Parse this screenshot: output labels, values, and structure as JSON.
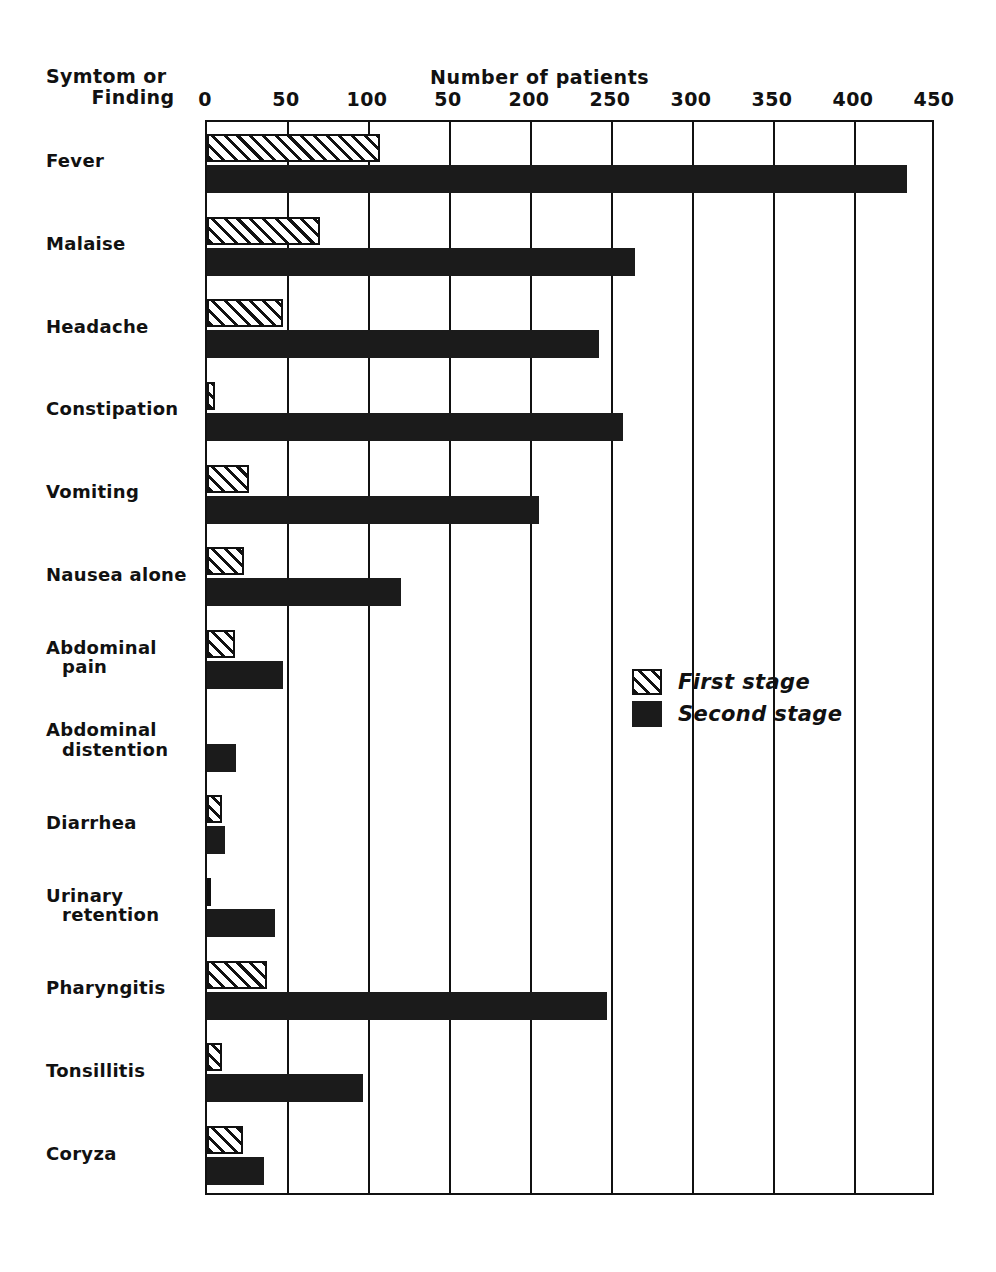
{
  "chart_data": {
    "type": "bar",
    "orientation": "horizontal",
    "title": "",
    "xlabel": "Number of patients",
    "ylabel": "Symtom or Finding",
    "corner_label_line1": "Symtom or",
    "corner_label_line2": "Finding",
    "xlim": [
      0,
      450
    ],
    "grid": true,
    "tick_values": [
      0,
      50,
      100,
      150,
      200,
      250,
      300,
      350,
      400,
      450
    ],
    "tick_labels": [
      "0",
      "50",
      "100",
      "50",
      "200",
      "250",
      "300",
      "350",
      "400",
      "450"
    ],
    "legend_position": "center-right",
    "categories": [
      "Fever",
      "Malaise",
      "Headache",
      "Constipation",
      "Vomiting",
      "Nausea alone",
      "Abdominal pain",
      "Abdominal distention",
      "Diarrhea",
      "Urinary retention",
      "Pharyngitis",
      "Tonsillitis",
      "Coryza"
    ],
    "category_lines": [
      [
        "Fever"
      ],
      [
        "Malaise"
      ],
      [
        "Headache"
      ],
      [
        "Constipation"
      ],
      [
        "Vomiting"
      ],
      [
        "Nausea alone"
      ],
      [
        "Abdominal",
        "pain"
      ],
      [
        "Abdominal",
        "distention"
      ],
      [
        "Diarrhea"
      ],
      [
        "Urinary",
        "retention"
      ],
      [
        "Pharyngitis"
      ],
      [
        "Tonsillitis"
      ],
      [
        "Coryza"
      ]
    ],
    "series": [
      {
        "name": "First stage",
        "fill": "hatched",
        "values": [
          107,
          70,
          47,
          5,
          26,
          23,
          17,
          0,
          9,
          2,
          37,
          9,
          22
        ]
      },
      {
        "name": "Second stage",
        "fill": "solid-black",
        "values": [
          432,
          264,
          242,
          257,
          205,
          120,
          47,
          18,
          11,
          42,
          247,
          96,
          35
        ]
      }
    ]
  },
  "legend": {
    "items": [
      {
        "label": "First stage",
        "style": "hatched"
      },
      {
        "label": "Second stage",
        "style": "solid"
      }
    ]
  },
  "colors": {
    "ink": "#111111",
    "bar_solid": "#1b1b1b",
    "background": "#ffffff"
  }
}
